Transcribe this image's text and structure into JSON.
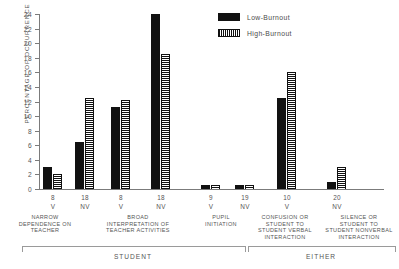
{
  "chart_data": {
    "type": "bar",
    "title": "",
    "xlabel": "",
    "ylabel": "PERCENTAGE OF OCCURRENCE",
    "ylim": [
      0,
      24
    ],
    "yticks": [
      0,
      2,
      4,
      6,
      8,
      10,
      12,
      14,
      16,
      18,
      20,
      22,
      24
    ],
    "grid": false,
    "legend_position": "top-right",
    "legend": [
      "Low-Burnout",
      "High-Burnout"
    ],
    "categories": [
      {
        "number": "8",
        "code": "V",
        "desc": [
          "NARROW",
          "DEPENDENCE ON",
          "TEACHER"
        ]
      },
      {
        "number": "18",
        "code": "NV",
        "desc": [
          "NARROW",
          "DEPENDENCE ON",
          "TEACHER"
        ]
      },
      {
        "number": "8",
        "code": "V",
        "desc": [
          "BROAD",
          "INTERPRETATION OF",
          "TEACHER ACTIVITIES"
        ]
      },
      {
        "number": "18",
        "code": "NV",
        "desc": [
          "BROAD",
          "INTERPRETATION OF",
          "TEACHER ACTIVITIES"
        ]
      },
      {
        "number": "9",
        "code": "V",
        "desc": [
          "PUPIL",
          "INITIATION"
        ]
      },
      {
        "number": "19",
        "code": "NV",
        "desc": [
          "PUPIL",
          "INITIATION"
        ]
      },
      {
        "number": "10",
        "code": "V",
        "desc": [
          "CONFUSION OR",
          "STUDENT TO",
          "STUDENT VERBAL",
          "INTERACTION"
        ]
      },
      {
        "number": "20",
        "code": "NV",
        "desc": [
          "SILENCE OR",
          "STUDENT TO",
          "STUDENT NONVERBAL",
          "INTERACTION"
        ]
      }
    ],
    "series": [
      {
        "name": "Low-Burnout",
        "values": [
          3.0,
          6.5,
          11.3,
          24.0,
          0.5,
          0.5,
          12.5,
          1.0
        ]
      },
      {
        "name": "High-Burnout",
        "values": [
          2.0,
          12.5,
          12.2,
          18.5,
          0.6,
          0.6,
          16.0,
          3.0
        ]
      }
    ],
    "group_brackets": [
      {
        "label": "STUDENT"
      },
      {
        "label": "EITHER"
      }
    ],
    "colors": {
      "low": "#111111",
      "high": "#111111",
      "axis": "#7b7b7b"
    }
  }
}
